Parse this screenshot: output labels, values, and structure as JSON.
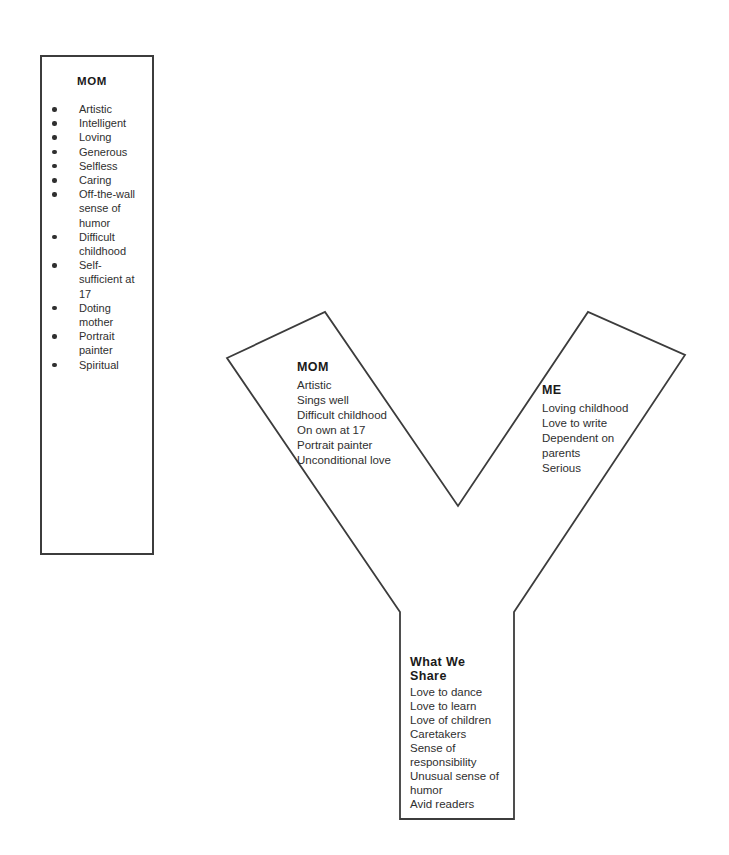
{
  "left_panel": {
    "title": "MOM",
    "items": [
      "Artistic",
      "Intelligent",
      "Loving",
      "Generous",
      "Selfless",
      "Caring",
      "Off-the-wall sense of humor",
      "Difficult childhood",
      "Self-sufficient at 17",
      "Doting mother",
      "Portrait painter",
      "Spiritual"
    ]
  },
  "y_chart": {
    "left_arm": {
      "title": "MOM",
      "items": [
        "Artistic",
        "Sings well",
        "Difficult childhood",
        "On own at 17",
        "Portrait painter",
        "Unconditional love"
      ]
    },
    "right_arm": {
      "title": "ME",
      "items": [
        "Loving childhood",
        "Love to write",
        "Dependent on parents",
        "Serious"
      ]
    },
    "stem": {
      "title": "What We Share",
      "items": [
        "Love to dance",
        "Love to learn",
        "Love of children",
        "Caretakers",
        "Sense of responsibility",
        "Unusual sense of humor",
        "Avid readers"
      ]
    }
  },
  "colors": {
    "outline": "#3c3c3c",
    "body_text": "#2f2f2f",
    "heading_text": "#1a1a1a",
    "background": "#ffffff"
  }
}
